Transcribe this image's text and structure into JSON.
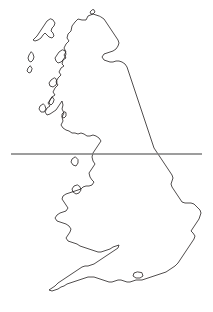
{
  "figure": {
    "type": "map",
    "background_color": "#ffffff",
    "width": 213,
    "height": 312
  },
  "style": {
    "coastline_color": "#231f20",
    "coastline_width": 0.8,
    "reference_line_color": "#7c7c7c",
    "reference_line_width": 1.6
  },
  "reference_line": {
    "name": "horizontal-latitude-line",
    "orientation": "horizontal",
    "y": 154,
    "x_start": 11,
    "x_end": 202,
    "color": "#7c7c7c"
  },
  "geometry": {
    "mainland_path": "M 99 16 L 93 14 L 88 16 L 86 20 L 82 20 L 78 19 L 75 22 L 72 26 L 71 31 L 68 34 L 67 38 L 69 41 L 66 44 L 64 48 L 66 52 L 64 55 L 66 58 L 63 60 L 62 64 L 64 66 L 61 68 L 59 72 L 61 75 L 58 78 L 56 82 L 58 85 L 55 88 L 53 92 L 55 95 L 52 97 L 50 100 L 48 103 L 50 106 L 47 108 L 45 112 L 47 115 L 50 114 L 53 112 L 56 110 L 58 107 L 60 104 L 62 101 L 63 105 L 62 109 L 64 113 L 62 117 L 63 121 L 61 125 L 63 128 L 66 130 L 69 131 L 72 133 L 75 133 L 78 134 L 81 133 L 84 134 L 87 136 L 90 136 L 93 135 L 96 136 L 99 138 L 101 141 L 99 144 L 97 147 L 95 150 L 93 153 L 92 157 L 93 161 L 95 164 L 93 167 L 91 170 L 89 173 L 90 177 L 92 180 L 94 182 L 92 185 L 89 186 L 86 186 L 83 187 L 81 189 L 78 190 L 75 191 L 72 192 L 69 193 L 66 194 L 63 196 L 62 199 L 64 202 L 66 205 L 68 208 L 66 211 L 63 212 L 60 213 L 57 215 L 55 218 L 57 221 L 60 222 L 63 223 L 66 224 L 69 226 L 71 229 L 70 232 L 68 235 L 66 238 L 68 241 L 71 242 L 74 243 L 77 244 L 80 246 L 83 247 L 86 248 L 89 249 L 92 250 L 95 251 L 98 252 L 101 252 L 104 251 L 107 250 L 110 249 L 113 247 L 116 246 L 119 245 L 118 248 L 115 250 L 112 252 L 109 254 L 106 256 L 103 258 L 100 260 L 97 262 L 94 264 L 91 265 L 88 266 L 85 266 L 82 267 L 79 269 L 76 271 L 73 273 L 70 275 L 67 277 L 64 279 L 61 281 L 58 283 L 55 286 L 52 288 L 49 290 L 52 291 L 55 290 L 58 289 L 61 287 L 64 286 L 67 284 L 70 283 L 73 282 L 76 281 L 79 280 L 82 279 L 85 278 L 88 277 L 91 277 L 94 277 L 97 278 L 100 279 L 103 280 L 106 281 L 109 282 L 112 282 L 115 281 L 118 280 L 121 280 L 124 281 L 127 282 L 130 282 L 133 281 L 136 280 L 139 280 L 142 280 L 145 279 L 148 278 L 151 277 L 154 276 L 157 275 L 160 274 L 163 273 L 166 272 L 169 270 L 172 268 L 175 266 L 178 263 L 180 260 L 182 257 L 184 254 L 186 251 L 188 248 L 190 245 L 192 242 L 194 239 L 195 236 L 193 233 L 191 231 L 193 228 L 195 225 L 197 222 L 199 219 L 200 216 L 201 213 L 200 210 L 198 208 L 196 206 L 194 204 L 191 203 L 188 203 L 185 203 L 182 202 L 180 199 L 178 196 L 176 193 L 174 190 L 172 187 L 171 184 L 172 181 L 173 178 L 172 175 L 170 172 L 168 169 L 166 166 L 164 163 L 162 160 L 160 157 L 158 154 L 156 151 L 154 148 L 153 145 L 152 142 L 151 139 L 150 136 L 149 133 L 148 130 L 147 127 L 146 124 L 145 121 L 144 118 L 143 115 L 142 112 L 141 109 L 140 106 L 139 103 L 138 100 L 137 97 L 136 94 L 135 91 L 134 88 L 133 85 L 132 82 L 131 79 L 130 76 L 129 73 L 128 70 L 127 67 L 125 64 L 122 62 L 119 61 L 116 61 L 113 62 L 110 62 L 107 61 L 104 60 L 102 57 L 104 54 L 107 53 L 110 52 L 113 51 L 116 49 L 118 46 L 119 43 L 118 40 L 116 37 L 114 34 L 112 31 L 110 28 L 108 25 L 106 22 L 104 19 L 101 17 Z",
    "islands": [
      {
        "name": "outer-hebrides-lewis-harris",
        "path": "M 50 19 L 47 21 L 45 24 L 43 27 L 41 30 L 39 33 L 37 36 L 35 38 L 33 40 L 35 41 L 38 40 L 41 38 L 43 35 L 45 33 L 47 35 L 49 37 L 52 38 L 54 36 L 53 33 L 51 31 L 52 28 L 54 26 L 55 23 L 53 20 Z"
      },
      {
        "name": "outer-hebrides-uist",
        "path": "M 31 52 L 29 55 L 28 58 L 29 61 L 31 62 L 33 60 L 34 57 L 33 54 Z"
      },
      {
        "name": "outer-hebrides-barra",
        "path": "M 30 66 L 28 68 L 27 71 L 29 73 L 31 72 L 32 69 Z"
      },
      {
        "name": "skye",
        "path": "M 62 50 L 59 52 L 57 55 L 55 58 L 56 61 L 58 63 L 61 62 L 63 60 L 65 57 L 66 54 L 65 51 Z"
      },
      {
        "name": "mull",
        "path": "M 54 78 L 51 80 L 49 83 L 50 86 L 53 87 L 56 85 L 57 82 L 56 79 Z"
      },
      {
        "name": "islay",
        "path": "M 43 104 L 40 106 L 39 109 L 41 112 L 44 112 L 46 109 L 45 106 Z"
      },
      {
        "name": "jura",
        "path": "M 52 97 L 50 100 L 49 103 L 51 105 L 53 103 L 54 100 Z"
      },
      {
        "name": "arran",
        "path": "M 64 112 L 62 114 L 62 117 L 64 118 L 66 116 L 66 113 Z"
      },
      {
        "name": "orkney-islands",
        "path": "M 92 10 L 90 12 L 91 14 L 93 14 L 95 12 L 94 10 Z"
      },
      {
        "name": "isle-of-man",
        "path": "M 75 157 L 72 159 L 71 162 L 73 165 L 76 166 L 78 163 L 78 160 Z"
      },
      {
        "name": "anglesey",
        "path": "M 77 185 L 74 186 L 72 189 L 73 192 L 76 194 L 79 193 L 81 190 L 80 187 Z"
      },
      {
        "name": "isle-of-wight",
        "path": "M 137 272 L 134 273 L 133 276 L 136 278 L 140 278 L 143 276 L 142 273 Z"
      }
    ]
  }
}
